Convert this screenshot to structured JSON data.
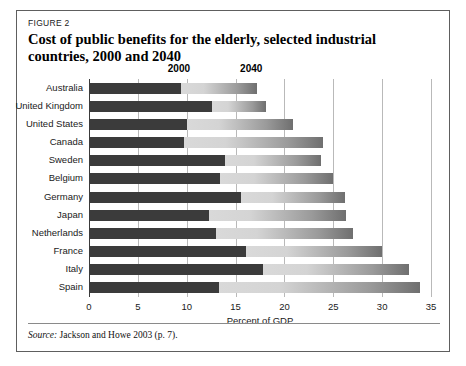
{
  "figure": {
    "label": "FIGURE 2",
    "title": "Cost of public benefits for the elderly, selected industrial countries, 2000 and 2040",
    "source_word": "Source:",
    "source_text": " Jackson and Howe 2003 (p. 7)."
  },
  "colors": {
    "series_2000": "#3b3b3b",
    "series_2040_light": "#d9d9d9",
    "series_2040_dark": "#6f6f6f",
    "gridline": "#b9b9b9",
    "axis": "#3a3a3a",
    "frame": "#5e5e5e"
  },
  "legend": [
    {
      "label": "2000",
      "at_value": 9.2
    },
    {
      "label": "2040",
      "at_value": 16.6
    }
  ],
  "chart_data": {
    "type": "bar",
    "orientation": "horizontal",
    "stacked": true,
    "title": "Cost of public benefits for the elderly, selected industrial countries, 2000 and 2040",
    "xlabel": "Percent of GDP",
    "ylabel": "",
    "xlim": [
      0,
      35
    ],
    "xticks": [
      0,
      5,
      10,
      15,
      20,
      25,
      30,
      35
    ],
    "grid": true,
    "legend_position": "top",
    "categories": [
      "Australia",
      "United Kingdom",
      "United States",
      "Canada",
      "Sweden",
      "Belgium",
      "Germany",
      "Japan",
      "Netherlands",
      "France",
      "Italy",
      "Spain"
    ],
    "series": [
      {
        "name": "2000",
        "values": [
          9.4,
          12.6,
          10.0,
          9.7,
          13.9,
          13.4,
          15.6,
          12.3,
          13.0,
          16.1,
          17.8,
          13.3
        ]
      },
      {
        "name": "2040",
        "values": [
          17.2,
          18.1,
          20.9,
          23.9,
          23.7,
          25.0,
          26.2,
          26.3,
          27.0,
          30.0,
          32.7,
          33.9
        ]
      }
    ]
  }
}
